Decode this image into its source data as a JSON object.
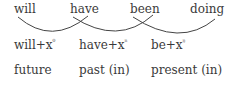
{
  "top_words": [
    "will",
    "have",
    "been",
    "doing"
  ],
  "affixes": [
    {
      "base": "will+x",
      "sup": "⁰"
    },
    {
      "base": "have+x",
      "sup": "ⁿ"
    },
    {
      "base": "be+x",
      "sup": "ᵑ"
    }
  ],
  "tenses": [
    "future",
    "past (in)",
    "present (in)"
  ]
}
